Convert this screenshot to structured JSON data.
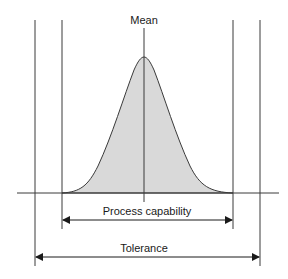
{
  "diagram": {
    "labels": {
      "mean": "Mean",
      "process_capability": "Process capability",
      "tolerance": "Tolerance"
    },
    "colors": {
      "line": "#3a3a3a",
      "fill": "#d9d9d9",
      "background": "#ffffff"
    }
  }
}
